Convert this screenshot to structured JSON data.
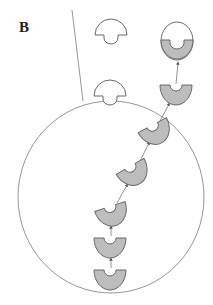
{
  "panel_label": "B",
  "colors": {
    "stroke": "#6a6a6a",
    "fill_gray": "#bdbdbd",
    "fill_white": "#ffffff",
    "line": "#8a8a8a"
  },
  "diagram": {
    "cell": {
      "cx": 111,
      "cy": 197,
      "rx": 93,
      "ry": 96
    },
    "boundary_line": {
      "x1": 72,
      "y1": 10,
      "x2": 83,
      "y2": 101
    },
    "empty_domes": [
      {
        "id": "dome-free",
        "x": 111,
        "y": 34
      },
      {
        "id": "dome-membrane",
        "x": 110,
        "y": 94
      }
    ],
    "filled_oval": {
      "x": 177,
      "y": 41
    },
    "u_units": [
      {
        "x": 176,
        "y": 95,
        "rot": 0
      },
      {
        "x": 155,
        "y": 135,
        "rot": -28
      },
      {
        "x": 134,
        "y": 175,
        "rot": -30
      },
      {
        "x": 113,
        "y": 216,
        "rot": -18
      },
      {
        "x": 110,
        "y": 248,
        "rot": 0
      },
      {
        "x": 110,
        "y": 280,
        "rot": 0
      }
    ]
  }
}
